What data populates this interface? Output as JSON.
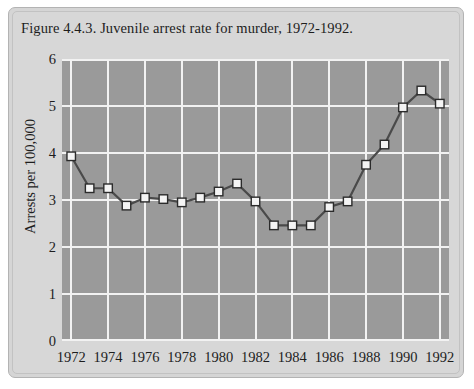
{
  "figure": {
    "title": "Figure 4.4.3. Juvenile arrest rate for murder, 1972-1992.",
    "panel_color": "#d7d7d7",
    "plot_background_color": "#9a9a9a",
    "gridline_color": "#f2f2f2",
    "line_color": "#4a4a4a",
    "marker_fill_color": "#f4f4f4",
    "marker_edge_color": "#2b2b2b"
  },
  "chart_data": {
    "type": "line",
    "title": "Figure 4.4.3. Juvenile arrest rate for murder, 1972-1992.",
    "xlabel": "",
    "ylabel": "Arrests per 100,000",
    "xlim": [
      1971.5,
      1992.5
    ],
    "ylim": [
      0,
      6
    ],
    "grid": true,
    "legend": "none",
    "y_ticks": [
      0,
      1,
      2,
      3,
      4,
      5,
      6
    ],
    "y_tick_labels": [
      "0",
      "1",
      "2",
      "3",
      "4",
      "5",
      "6"
    ],
    "x_ticks": [
      1972,
      1974,
      1976,
      1978,
      1980,
      1982,
      1984,
      1986,
      1988,
      1990,
      1992
    ],
    "x_tick_labels": [
      "1972",
      "1974",
      "1976",
      "1978",
      "1980",
      "1982",
      "1984",
      "1986",
      "1988",
      "1990",
      "1992"
    ],
    "x": [
      1972,
      1973,
      1974,
      1975,
      1976,
      1977,
      1978,
      1979,
      1980,
      1981,
      1982,
      1983,
      1984,
      1985,
      1986,
      1987,
      1988,
      1989,
      1990,
      1991,
      1992
    ],
    "values": [
      3.93,
      3.25,
      3.25,
      2.88,
      3.05,
      3.02,
      2.95,
      3.05,
      3.18,
      3.35,
      2.97,
      2.46,
      2.46,
      2.46,
      2.85,
      2.97,
      3.75,
      4.18,
      4.97,
      5.33,
      5.05
    ],
    "series": [
      {
        "name": "Juvenile arrest rate for murder",
        "values": [
          3.93,
          3.25,
          3.25,
          2.88,
          3.05,
          3.02,
          2.95,
          3.05,
          3.18,
          3.35,
          2.97,
          2.46,
          2.46,
          2.46,
          2.85,
          2.97,
          3.75,
          4.18,
          4.97,
          5.33,
          5.05
        ]
      }
    ]
  }
}
